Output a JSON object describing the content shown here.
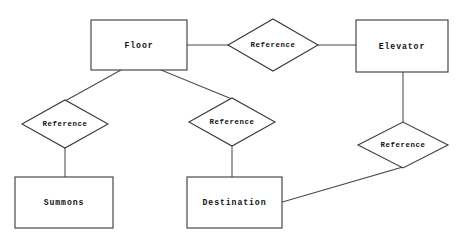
{
  "diagram": {
    "type": "entity-relationship-diagram",
    "title": "",
    "background_color": "#ffffff",
    "line_color": "#3a3a3a",
    "text_color": "#111111",
    "entities": [
      {
        "id": "floor",
        "label": "Floor",
        "shape": "rectangle",
        "x": 91,
        "y": 20,
        "width": 96,
        "height": 50
      },
      {
        "id": "elevator",
        "label": "Elevator",
        "shape": "rectangle",
        "x": 356,
        "y": 20,
        "width": 92,
        "height": 52
      },
      {
        "id": "summons",
        "label": "Summons",
        "shape": "rectangle",
        "x": 15,
        "y": 177,
        "width": 98,
        "height": 51
      },
      {
        "id": "destination",
        "label": "Destination",
        "shape": "rectangle",
        "x": 187,
        "y": 177,
        "width": 95,
        "height": 51
      }
    ],
    "relationships": [
      {
        "id": "rel-floor-elevator",
        "label": "Reference",
        "shape": "diamond",
        "cx": 273,
        "cy": 44,
        "rx": 45,
        "ry": 26
      },
      {
        "id": "rel-floor-summons",
        "label": "Reference",
        "shape": "diamond",
        "cx": 65,
        "cy": 124,
        "rx": 43,
        "ry": 24
      },
      {
        "id": "rel-floor-destination",
        "label": "Reference",
        "shape": "diamond",
        "cx": 232,
        "cy": 122,
        "rx": 43,
        "ry": 24
      },
      {
        "id": "rel-elevator-destination",
        "label": "Reference",
        "shape": "diamond",
        "cx": 403,
        "cy": 145,
        "rx": 45,
        "ry": 23
      }
    ],
    "connections": [
      {
        "id": "edge-floor-to-rel1",
        "from": "floor",
        "to": "rel-floor-elevator"
      },
      {
        "id": "edge-rel1-to-elevator",
        "from": "rel-floor-elevator",
        "to": "elevator"
      },
      {
        "id": "edge-floor-to-rel2",
        "from": "floor",
        "to": "rel-floor-summons"
      },
      {
        "id": "edge-rel2-to-summons",
        "from": "rel-floor-summons",
        "to": "summons"
      },
      {
        "id": "edge-floor-to-rel3",
        "from": "floor",
        "to": "rel-floor-destination"
      },
      {
        "id": "edge-rel3-to-destination",
        "from": "rel-floor-destination",
        "to": "destination"
      },
      {
        "id": "edge-elevator-to-rel4",
        "from": "elevator",
        "to": "rel-elevator-destination"
      },
      {
        "id": "edge-rel4-to-destination",
        "from": "rel-elevator-destination",
        "to": "destination"
      }
    ]
  }
}
